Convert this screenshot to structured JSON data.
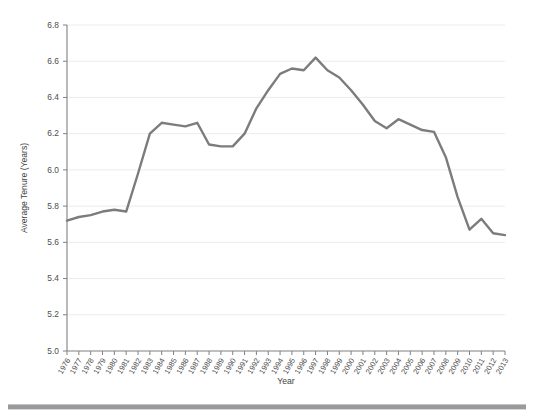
{
  "chart_data": {
    "type": "line",
    "title": "",
    "subtitle": "",
    "xlabel": "Year",
    "ylabel": "Average Tenure (Years)",
    "grid": true,
    "legend": null,
    "legend_position": "none",
    "line_color": "#7c7c7c",
    "axis_color": "#808080",
    "grid_color": "#ececed",
    "xlim": [
      1976,
      2013
    ],
    "ylim": [
      5.0,
      6.8
    ],
    "ytick_step": 0.2,
    "ytick_labels": [
      "5.0",
      "5.2",
      "5.4",
      "5.6",
      "5.8",
      "6.0",
      "6.2",
      "6.4",
      "6.6",
      "6.8"
    ],
    "ytick_values": [
      5.0,
      5.2,
      5.4,
      5.6,
      5.8,
      6.0,
      6.2,
      6.4,
      6.6,
      6.8
    ],
    "categories": [
      "1976",
      "1977",
      "1978",
      "1979",
      "1980",
      "1981",
      "1982",
      "1983",
      "1984",
      "1985",
      "1986",
      "1987",
      "1988",
      "1989",
      "1990",
      "1991",
      "1992",
      "1993",
      "1994",
      "1995",
      "1996",
      "1997",
      "1998",
      "1999",
      "2000",
      "2001",
      "2002",
      "2003",
      "2004",
      "2005",
      "2006",
      "2007",
      "2008",
      "2009",
      "2010",
      "2011",
      "2012",
      "2013"
    ],
    "x": [
      1976,
      1977,
      1978,
      1979,
      1980,
      1981,
      1982,
      1983,
      1984,
      1985,
      1986,
      1987,
      1988,
      1989,
      1990,
      1991,
      1992,
      1993,
      1994,
      1995,
      1996,
      1997,
      1998,
      1999,
      2000,
      2001,
      2002,
      2003,
      2004,
      2005,
      2006,
      2007,
      2008,
      2009,
      2010,
      2011,
      2012,
      2013
    ],
    "values": [
      5.72,
      5.74,
      5.75,
      5.77,
      5.78,
      5.77,
      5.98,
      6.2,
      6.26,
      6.25,
      6.24,
      6.26,
      6.14,
      6.13,
      6.13,
      6.2,
      6.34,
      6.44,
      6.53,
      6.56,
      6.55,
      6.62,
      6.55,
      6.51,
      6.44,
      6.36,
      6.27,
      6.23,
      6.28,
      6.25,
      6.22,
      6.21,
      6.07,
      5.85,
      5.67,
      5.73,
      5.65,
      5.64
    ],
    "series": [
      {
        "name": "Average Tenure (Years)",
        "color": "#7c7c7c",
        "values": [
          5.72,
          5.74,
          5.75,
          5.77,
          5.78,
          5.77,
          5.98,
          6.2,
          6.26,
          6.25,
          6.24,
          6.26,
          6.14,
          6.13,
          6.13,
          6.2,
          6.34,
          6.44,
          6.53,
          6.56,
          6.55,
          6.62,
          6.55,
          6.51,
          6.44,
          6.36,
          6.27,
          6.23,
          6.28,
          6.25,
          6.22,
          6.21,
          6.07,
          5.85,
          5.67,
          5.73,
          5.65,
          5.64
        ]
      }
    ],
    "annotations": []
  }
}
